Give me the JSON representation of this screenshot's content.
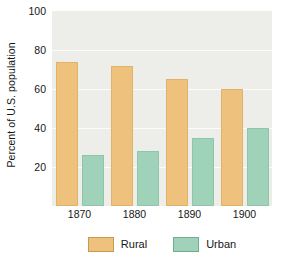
{
  "chart_data": {
    "type": "bar",
    "title": "",
    "xlabel": "",
    "ylabel": "Percent of U.S. population",
    "categories": [
      "1870",
      "1880",
      "1890",
      "1900"
    ],
    "series": [
      {
        "name": "Rural",
        "color": "#eec27d",
        "values": [
          74,
          72,
          65,
          60
        ]
      },
      {
        "name": "Urban",
        "color": "#9fd2b8",
        "values": [
          26,
          28,
          35,
          40
        ]
      }
    ],
    "ylim": [
      0,
      100
    ],
    "yticks": [
      20,
      40,
      60,
      80,
      100
    ],
    "ytick_labels": [
      "20",
      "40",
      "60",
      "80",
      "100"
    ],
    "grid": true,
    "legend_position": "bottom",
    "plot_background": "#edeee9",
    "figure_background": "#ffffff"
  },
  "legend": {
    "entries": [
      {
        "label": "Rural"
      },
      {
        "label": "Urban"
      }
    ]
  }
}
